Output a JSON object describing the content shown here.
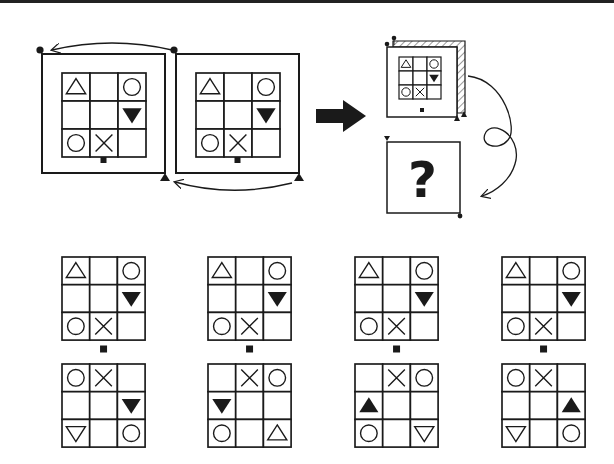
{
  "colors": {
    "ink": "#1a1a1a",
    "background": "#ffffff",
    "hatch": "#555555"
  },
  "symbols": {
    "tri_up": "triangle-up-outline",
    "tri_down": "triangle-down-outline",
    "tri_down_fill": "triangle-down-filled",
    "tri_up_fill": "triangle-up-filled",
    "circle": "circle-outline",
    "x": "cross",
    "empty": "empty"
  },
  "question": {
    "source_grid": [
      [
        "tri_up",
        "empty",
        "circle"
      ],
      [
        "empty",
        "empty",
        "tri_down_fill"
      ],
      [
        "circle",
        "x",
        "empty"
      ]
    ],
    "frames": [
      {
        "id": "frame-1",
        "x": 42,
        "y": 54,
        "size": 123,
        "grid_x": 62,
        "grid_y": 73,
        "cell": 28,
        "marker_top_left": "dot",
        "marker_bottom_right": "triangle"
      },
      {
        "id": "frame-2",
        "x": 176,
        "y": 54,
        "size": 123,
        "grid_x": 196,
        "grid_y": 73,
        "cell": 28,
        "marker_top_left": "dot",
        "marker_bottom_right": "triangle"
      }
    ],
    "arrow_label": "transform-arrow",
    "folded_panel": {
      "x": 387,
      "y": 47,
      "size": 70,
      "grid_x": 399,
      "grid_y": 57,
      "cell": 14
    },
    "unknown_panel": {
      "x": 387,
      "y": 142,
      "size": 73,
      "mark": "?"
    }
  },
  "options": [
    {
      "label": "A",
      "x": 62,
      "top": [
        [
          "tri_up",
          "empty",
          "circle"
        ],
        [
          "empty",
          "empty",
          "tri_down_fill"
        ],
        [
          "circle",
          "x",
          "empty"
        ]
      ],
      "bottom": [
        [
          "circle",
          "x",
          "empty"
        ],
        [
          "empty",
          "empty",
          "tri_down_fill"
        ],
        [
          "tri_down",
          "empty",
          "circle"
        ]
      ]
    },
    {
      "label": "B",
      "x": 208,
      "top": [
        [
          "tri_up",
          "empty",
          "circle"
        ],
        [
          "empty",
          "empty",
          "tri_down_fill"
        ],
        [
          "circle",
          "x",
          "empty"
        ]
      ],
      "bottom": [
        [
          "empty",
          "x",
          "circle"
        ],
        [
          "tri_down_fill",
          "empty",
          "empty"
        ],
        [
          "circle",
          "empty",
          "tri_up"
        ]
      ]
    },
    {
      "label": "C",
      "x": 355,
      "top": [
        [
          "tri_up",
          "empty",
          "circle"
        ],
        [
          "empty",
          "empty",
          "tri_down_fill"
        ],
        [
          "circle",
          "x",
          "empty"
        ]
      ],
      "bottom": [
        [
          "empty",
          "x",
          "circle"
        ],
        [
          "tri_up_fill",
          "empty",
          "empty"
        ],
        [
          "circle",
          "empty",
          "tri_down"
        ]
      ]
    },
    {
      "label": "D",
      "x": 502,
      "top": [
        [
          "tri_up",
          "empty",
          "circle"
        ],
        [
          "empty",
          "empty",
          "tri_down_fill"
        ],
        [
          "circle",
          "x",
          "empty"
        ]
      ],
      "bottom": [
        [
          "circle",
          "x",
          "empty"
        ],
        [
          "empty",
          "empty",
          "tri_up_fill"
        ],
        [
          "tri_down",
          "empty",
          "circle"
        ]
      ]
    }
  ],
  "option_layout": {
    "top_y": 257,
    "bottom_y": 364,
    "cell": 27.7,
    "dot_y": 349
  }
}
